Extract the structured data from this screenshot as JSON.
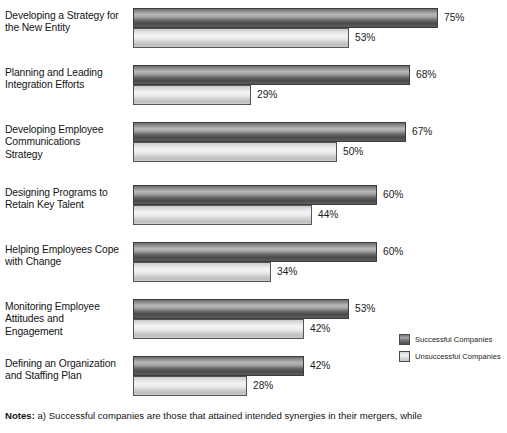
{
  "chart_data": {
    "type": "bar",
    "orientation": "horizontal",
    "title": "",
    "xlabel": "",
    "ylabel": "",
    "xlim": [
      0,
      80
    ],
    "grid": false,
    "legend_position": "bottom-right",
    "value_suffix": "%",
    "categories": [
      "Developing a Strategy for the New Entity",
      "Planning and Leading Integration Efforts",
      "Developing Employee Communications Strategy",
      "Designing Programs to Retain Key Talent",
      "Helping Employees Cope with Change",
      "Monitoring Employee Attitudes and Engagement",
      "Defining an Organization and Staffing Plan"
    ],
    "series": [
      {
        "name": "Successful Companies",
        "color": "#8a8a8a",
        "values": [
          75,
          68,
          67,
          60,
          60,
          53,
          42
        ],
        "labels": [
          "75%",
          "68%",
          "67%",
          "60%",
          "60%",
          "53%",
          "42%"
        ]
      },
      {
        "name": "Unsuccessful Companies",
        "color": "#e2e2e2",
        "values": [
          53,
          29,
          50,
          44,
          34,
          42,
          28
        ],
        "labels": [
          "53%",
          "29%",
          "50%",
          "44%",
          "34%",
          "42%",
          "28%"
        ]
      }
    ]
  },
  "category_lines": [
    [
      "Developing a Strategy for",
      "the New Entity"
    ],
    [
      "Planning and Leading",
      "Integration Efforts"
    ],
    [
      "Developing Employee",
      "Communications",
      "Strategy"
    ],
    [
      "Designing Programs to",
      "Retain Key Talent"
    ],
    [
      "Helping Employees Cope",
      "with Change"
    ],
    [
      "Monitoring Employee",
      "Attitudes and",
      "Engagement"
    ],
    [
      "Defining an Organization",
      "and Staffing Plan"
    ]
  ],
  "legend": {
    "items": [
      {
        "label": "Successful Companies",
        "style": "dark"
      },
      {
        "label": "Unsuccessful Companies",
        "style": "light"
      }
    ]
  },
  "notes": {
    "label": "Notes:",
    "text": " a) Successful companies are those that attained intended synergies in their mergers, while"
  }
}
